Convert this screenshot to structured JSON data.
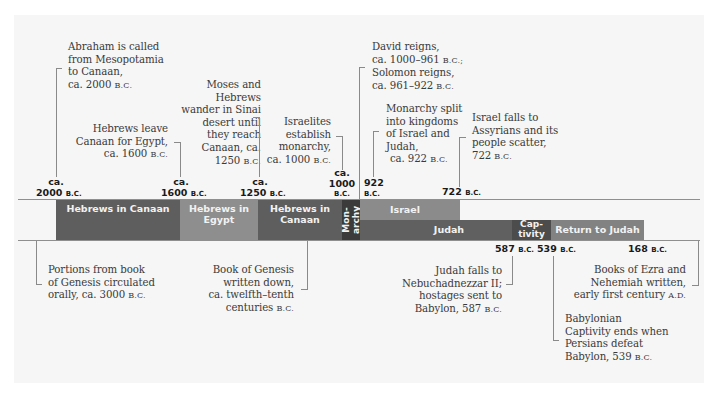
{
  "colors": {
    "canaan": "#5e5e5e",
    "egypt": "#8e8e8e",
    "monarchy": "#3b3b3b",
    "israel": "#8b8b8b",
    "judah": "#606060",
    "captivity": "#4c4c4c",
    "return": "#828282",
    "panel": "#f6f6f6"
  },
  "top_dates": [
    {
      "line1": "ca.",
      "line2": "2000",
      "era": "B.C."
    },
    {
      "line1": "ca.",
      "line2": "1600",
      "era": "B.C."
    },
    {
      "line1": "ca.",
      "line2": "1250",
      "era": "B.C."
    },
    {
      "line1": "ca.",
      "line2": "1000",
      "era": "B.C."
    },
    {
      "line1": "",
      "line2": "922",
      "era": "B.C."
    },
    {
      "line1": "",
      "line2": "722",
      "era": "B.C."
    }
  ],
  "bottom_dates": [
    {
      "year": "587",
      "era": "B.C."
    },
    {
      "year": "539",
      "era": "B.C."
    },
    {
      "year": "168",
      "era": "B.C."
    }
  ],
  "bands": [
    {
      "label": "Hebrews in Canaan"
    },
    {
      "label": "Hebrews in Egypt"
    },
    {
      "label": "Hebrews in Canaan"
    },
    {
      "label": "Mon-archy"
    },
    {
      "label": "Israel"
    },
    {
      "label": "Judah"
    },
    {
      "label": "Cap-tivity"
    },
    {
      "label": "Return to Judah"
    }
  ],
  "top_notes": [
    {
      "lines": [
        "Abraham is called",
        "from Mesopotamia",
        "to Canaan,"
      ],
      "date": "ca. 2000 ",
      "era": "B.C."
    },
    {
      "lines": [
        "Hebrews leave",
        "Canaan for Egypt,"
      ],
      "date": "ca. 1600 ",
      "era": "B.C."
    },
    {
      "lines": [
        "Moses and",
        "Hebrews",
        "wander in Sinai",
        "desert until",
        "they reach",
        "Canaan, ca."
      ],
      "date": "1250 ",
      "era": "B.C."
    },
    {
      "lines": [
        "Israelites",
        "establish",
        "monarchy,"
      ],
      "date": "ca. 1000 ",
      "era": "B.C."
    },
    {
      "lines": [
        "David reigns,"
      ],
      "line2": "ca. 1000–961 ",
      "era2": "B.C.;",
      "line3": "Solomon reigns,",
      "date": "ca. 961–922 ",
      "era": "B.C."
    },
    {
      "lines": [
        "Monarchy split",
        "into kingdoms",
        "of Israel and",
        "Judah,"
      ],
      "date": "ca. 922 ",
      "era": "B.C."
    },
    {
      "lines": [
        "Israel falls to",
        "Assyrians and its",
        "people scatter,"
      ],
      "date": "722 ",
      "era": "B.C."
    }
  ],
  "bottom_notes": [
    {
      "lines": [
        "Portions from book",
        "of Genesis circulated"
      ],
      "date": "orally, ca. 3000 ",
      "era": "B.C."
    },
    {
      "lines": [
        "Book of Genesis",
        "written down,",
        "ca. twelfth–tenth"
      ],
      "date": "centuries ",
      "era": "B.C."
    },
    {
      "lines": [
        "Judah falls to",
        "Nebuchadnezzar II;",
        "hostages sent to"
      ],
      "date": "Babylon, 587 ",
      "era": "B.C."
    },
    {
      "lines": [
        "Books of Ezra and",
        "Nehemiah written,"
      ],
      "date": "early first century ",
      "era": "A.D."
    },
    {
      "lines": [
        "Babylonian",
        "Captivity ends when",
        "Persians defeat"
      ],
      "date": "Babylon, 539 ",
      "era": "B.C."
    }
  ]
}
